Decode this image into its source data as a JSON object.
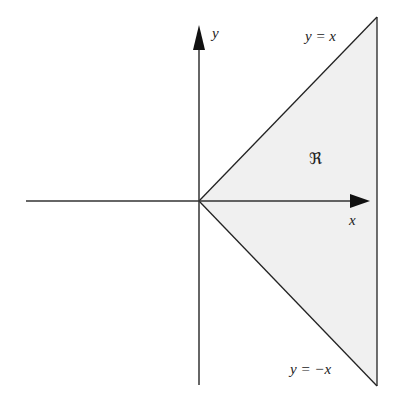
{
  "diagram": {
    "axes": {
      "x_label": "x",
      "y_label": "y"
    },
    "lines": {
      "upper": "y = x",
      "lower": "y = −x"
    },
    "region": {
      "label": "ℜ",
      "fill": "#f0f0f0"
    },
    "colors": {
      "stroke": "#222222",
      "background": "#ffffff"
    }
  }
}
